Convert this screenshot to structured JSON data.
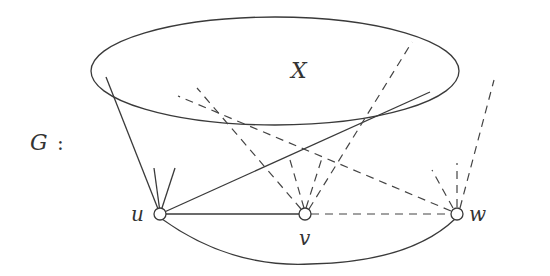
{
  "figure": {
    "graph_label": "G",
    "graph_label_colon": ":",
    "set_label": "X",
    "vertices": [
      {
        "id": "u",
        "label": "u",
        "x": 160,
        "y": 214
      },
      {
        "id": "v",
        "label": "v",
        "x": 305,
        "y": 214
      },
      {
        "id": "w",
        "label": "w",
        "x": 457,
        "y": 214
      }
    ],
    "set_ellipse": {
      "cx": 275,
      "cy": 71,
      "rx": 184,
      "ry": 54
    },
    "edges_solid": [
      {
        "from": "u",
        "to": "v"
      },
      {
        "from": "u",
        "to": "X",
        "note": "long diagonal into X"
      },
      {
        "from": "u",
        "to": "X",
        "note": "left edge into X"
      },
      {
        "from": "u",
        "to": "w",
        "note": "curved lower arc"
      }
    ],
    "edges_dashed": [
      {
        "from": "v",
        "to": "w"
      },
      {
        "from": "v",
        "to": "X"
      },
      {
        "from": "w",
        "to": "X"
      }
    ],
    "colors": {
      "stroke": "#3a3a3a",
      "background": "#ffffff"
    }
  }
}
